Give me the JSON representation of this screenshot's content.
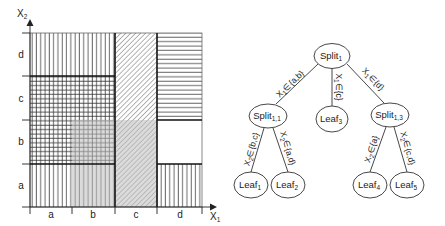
{
  "partition_plot": {
    "x_axis_label": "X",
    "x_axis_sub": "1",
    "y_axis_label": "X",
    "y_axis_sub": "2",
    "x_ticks": [
      "a",
      "b",
      "c",
      "d"
    ],
    "y_ticks": [
      "a",
      "b",
      "c",
      "d"
    ],
    "regions": [
      {
        "name": "leaf1",
        "x_range": "a-b",
        "y_range": "b-c",
        "pattern": "grid"
      },
      {
        "name": "leaf2",
        "x_range": "a-b",
        "y_range": "a,d",
        "pattern": "vertical"
      },
      {
        "name": "leaf3",
        "x_range": "c",
        "y_range": "a-d",
        "pattern": "diagonal"
      },
      {
        "name": "leaf4",
        "x_range": "d",
        "y_range": "a",
        "pattern": "vertical"
      },
      {
        "name": "leaf5",
        "x_range": "d",
        "y_range": "c-d",
        "pattern": "horizontal"
      }
    ],
    "highlight": {
      "x_range": "b-c",
      "y_range": "a-b",
      "color": "#c8c8c8"
    }
  },
  "tree": {
    "nodes": {
      "root": {
        "label": "Split",
        "sub": "1"
      },
      "split11": {
        "label": "Split",
        "sub": "1,1"
      },
      "leaf3": {
        "label": "Leaf",
        "sub": "3"
      },
      "split13": {
        "label": "Split",
        "sub": "1,3"
      },
      "leaf1": {
        "label": "Leaf",
        "sub": "1"
      },
      "leaf2": {
        "label": "Leaf",
        "sub": "2"
      },
      "leaf4": {
        "label": "Leaf",
        "sub": "4"
      },
      "leaf5": {
        "label": "Leaf",
        "sub": "5"
      }
    },
    "edges": {
      "root_split11": {
        "var": "X",
        "sub": "1",
        "cond": "∈{a,b}"
      },
      "root_leaf3": {
        "var": "X",
        "sub": "1",
        "cond": "∈{c}"
      },
      "root_split13": {
        "var": "X",
        "sub": "1",
        "cond": "∈{d}"
      },
      "split11_leaf1": {
        "var": "X",
        "sub": "2",
        "cond": "∈{b,c}"
      },
      "split11_leaf2": {
        "var": "X",
        "sub": "2",
        "cond": "∈{a,d}"
      },
      "split13_leaf4": {
        "var": "X",
        "sub": "2",
        "cond": "∈{a}"
      },
      "split13_leaf5": {
        "var": "X",
        "sub": "2",
        "cond": "∈{c,d}"
      }
    }
  }
}
